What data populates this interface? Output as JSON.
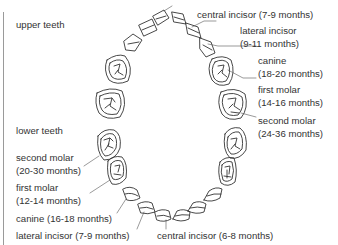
{
  "diagram": {
    "section_labels": {
      "upper": "upper teeth",
      "lower": "lower teeth"
    },
    "upper_teeth": [
      {
        "name": "central incisor",
        "eruption": "(7-9 months)",
        "line1": "central incisor  (7-9 months)"
      },
      {
        "name": "lateral incisor",
        "eruption": "(9-11 months)"
      },
      {
        "name": "canine",
        "eruption": "(18-20 months)"
      },
      {
        "name": "first molar",
        "eruption": "(14-16 months)"
      },
      {
        "name": "second molar",
        "eruption": "(24-36 months)"
      }
    ],
    "lower_teeth": [
      {
        "name": "second molar",
        "eruption": "(20-30 months)"
      },
      {
        "name": "first molar",
        "eruption": "(12-14 months)"
      },
      {
        "name": "canine",
        "eruption": "(16-18 months)",
        "line1": "canine (16-18 months)"
      },
      {
        "name": "lateral incisor",
        "eruption": "(7-9 months)",
        "line1": "lateral incisor (7-9 months)"
      },
      {
        "name": "central incisor",
        "eruption": "(6-8 months)",
        "line1": "central incisor (6-8 months)"
      }
    ]
  }
}
